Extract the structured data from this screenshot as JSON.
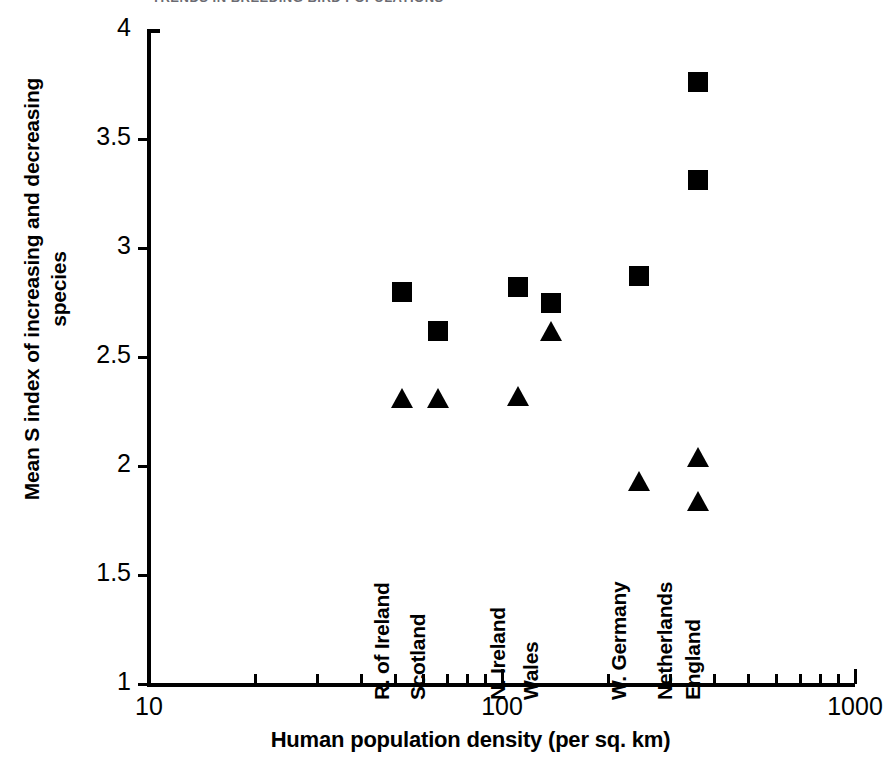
{
  "figure": {
    "header_artifact": "TRENDS IN BREEDING BIRD POPULATIONS",
    "background_color": "#ffffff",
    "marker_color": "#000000"
  },
  "chart_data": {
    "type": "scatter",
    "title": "",
    "xlabel": "Human population density (per sq. km)",
    "ylabel": "Mean S index of increasing and decreasing species",
    "ylabel_line1": "Mean S index of increasing and decreasing",
    "ylabel_line2": "species",
    "xscale": "log",
    "yscale": "linear",
    "xlim": [
      10,
      1000
    ],
    "ylim": [
      1,
      4
    ],
    "grid": false,
    "legend": "none",
    "yticks": [
      "1",
      "1.5",
      "2",
      "2.5",
      "3",
      "3.5",
      "4"
    ],
    "ytick_values": [
      1,
      1.5,
      2,
      2.5,
      3,
      3.5,
      4
    ],
    "xticks": [
      "10",
      "100",
      "1000"
    ],
    "xtick_values": [
      10,
      100,
      1000
    ],
    "series": [
      {
        "name": "increasing species",
        "marker": "square",
        "points": [
          {
            "country": "R. of Ireland",
            "x": 52,
            "y": 2.8
          },
          {
            "country": "Scotland",
            "x": 66,
            "y": 2.62
          },
          {
            "country": "N. Ireland",
            "x": 111,
            "y": 2.82
          },
          {
            "country": "Wales",
            "x": 138,
            "y": 2.75
          },
          {
            "country": "W. Germany",
            "x": 245,
            "y": 2.87
          },
          {
            "country": "Netherlands",
            "x": 360,
            "y": 3.76
          },
          {
            "country": "England",
            "x": 360,
            "y": 3.31
          }
        ]
      },
      {
        "name": "decreasing species",
        "marker": "triangle",
        "points": [
          {
            "country": "R. of Ireland",
            "x": 52,
            "y": 2.31
          },
          {
            "country": "Scotland",
            "x": 66,
            "y": 2.31
          },
          {
            "country": "N. Ireland",
            "x": 111,
            "y": 2.32
          },
          {
            "country": "Wales",
            "x": 138,
            "y": 2.62
          },
          {
            "country": "W. Germany",
            "x": 245,
            "y": 1.93
          },
          {
            "country": "Netherlands",
            "x": 360,
            "y": 2.04
          },
          {
            "country": "England",
            "x": 360,
            "y": 1.84
          }
        ]
      }
    ],
    "country_annotations": [
      {
        "label": "R. of Ireland",
        "x": 52
      },
      {
        "label": "Scotland",
        "x": 66
      },
      {
        "label": "N. Ireland",
        "x": 111
      },
      {
        "label": "Wales",
        "x": 138
      },
      {
        "label": "W. Germany",
        "x": 245
      },
      {
        "label": "Netherlands",
        "x": 330
      },
      {
        "label": "England",
        "x": 395
      }
    ]
  }
}
